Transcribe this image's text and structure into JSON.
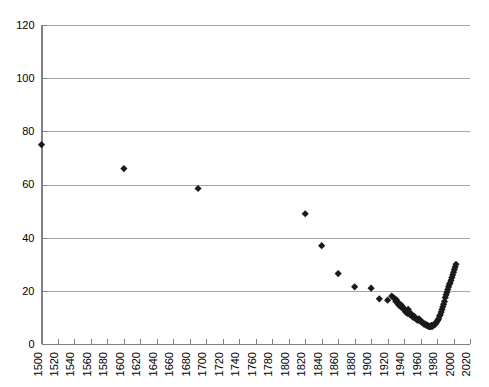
{
  "chart_data": {
    "type": "scatter",
    "title": "",
    "subtitle": "",
    "xlabel": "",
    "ylabel": "",
    "xlim": [
      1500,
      2020
    ],
    "ylim": [
      0,
      120
    ],
    "grid": true,
    "grid_axis": "y",
    "legend": false,
    "legend_position": "none",
    "marker": "diamond",
    "marker_color": "#1a1a1a",
    "y_ticks": [
      0,
      20,
      40,
      60,
      80,
      100,
      120
    ],
    "y_tick_labels": [
      "0",
      "20",
      "40",
      "60",
      "80",
      "100",
      "120"
    ],
    "x_ticks": [
      1500,
      1520,
      1540,
      1560,
      1580,
      1600,
      1620,
      1640,
      1660,
      1680,
      1700,
      1720,
      1740,
      1760,
      1780,
      1800,
      1820,
      1840,
      1860,
      1880,
      1900,
      1920,
      1940,
      1960,
      1980,
      2000,
      2020
    ],
    "x_tick_labels": [
      "1500",
      "1520",
      "1540",
      "1560",
      "1580",
      "1600",
      "1620",
      "1640",
      "1660",
      "1680",
      "1700",
      "1720",
      "1740",
      "1760",
      "1780",
      "1800",
      "1820",
      "1840",
      "1860",
      "1880",
      "1900",
      "1920",
      "1940",
      "1960",
      "1980",
      "2000",
      "2020"
    ],
    "x_tick_label_rotation": -90,
    "series": [
      {
        "name": "series-1",
        "points": [
          [
            1500,
            75.0
          ],
          [
            1600,
            66.0
          ],
          [
            1690,
            58.5
          ],
          [
            1820,
            49.0
          ],
          [
            1840,
            37.0
          ],
          [
            1860,
            26.5
          ],
          [
            1880,
            21.5
          ],
          [
            1900,
            21.0
          ],
          [
            1910,
            17.0
          ],
          [
            1920,
            16.5
          ],
          [
            1925,
            18.0
          ],
          [
            1927,
            17.5
          ],
          [
            1929,
            17.0
          ],
          [
            1930,
            16.0
          ],
          [
            1931,
            16.5
          ],
          [
            1932,
            15.5
          ],
          [
            1933,
            15.0
          ],
          [
            1934,
            14.5
          ],
          [
            1935,
            15.0
          ],
          [
            1936,
            14.0
          ],
          [
            1937,
            14.5
          ],
          [
            1938,
            14.0
          ],
          [
            1939,
            13.5
          ],
          [
            1940,
            13.0
          ],
          [
            1941,
            12.5
          ],
          [
            1942,
            12.0
          ],
          [
            1943,
            12.5
          ],
          [
            1944,
            11.5
          ],
          [
            1945,
            13.0
          ],
          [
            1946,
            12.0
          ],
          [
            1947,
            11.0
          ],
          [
            1948,
            11.5
          ],
          [
            1949,
            11.0
          ],
          [
            1950,
            10.5
          ],
          [
            1951,
            10.0
          ],
          [
            1952,
            10.5
          ],
          [
            1953,
            10.0
          ],
          [
            1954,
            9.5
          ],
          [
            1955,
            9.5
          ],
          [
            1956,
            9.0
          ],
          [
            1957,
            9.0
          ],
          [
            1958,
            9.5
          ],
          [
            1959,
            9.0
          ],
          [
            1960,
            8.5
          ],
          [
            1961,
            8.5
          ],
          [
            1962,
            8.0
          ],
          [
            1963,
            8.0
          ],
          [
            1964,
            7.5
          ],
          [
            1965,
            7.5
          ],
          [
            1966,
            7.5
          ],
          [
            1967,
            7.0
          ],
          [
            1968,
            7.0
          ],
          [
            1969,
            7.0
          ],
          [
            1970,
            6.5
          ],
          [
            1971,
            6.5
          ],
          [
            1972,
            6.5
          ],
          [
            1973,
            7.0
          ],
          [
            1974,
            6.5
          ],
          [
            1975,
            7.0
          ],
          [
            1976,
            7.0
          ],
          [
            1977,
            7.5
          ],
          [
            1978,
            7.5
          ],
          [
            1979,
            8.0
          ],
          [
            1980,
            8.5
          ],
          [
            1981,
            9.0
          ],
          [
            1982,
            9.5
          ],
          [
            1983,
            10.5
          ],
          [
            1984,
            11.0
          ],
          [
            1985,
            12.0
          ],
          [
            1986,
            13.0
          ],
          [
            1987,
            14.0
          ],
          [
            1988,
            15.0
          ],
          [
            1989,
            16.0
          ],
          [
            1990,
            17.5
          ],
          [
            1991,
            18.5
          ],
          [
            1992,
            19.5
          ],
          [
            1993,
            20.5
          ],
          [
            1994,
            21.5
          ],
          [
            1995,
            22.5
          ],
          [
            1996,
            23.0
          ],
          [
            1997,
            24.0
          ],
          [
            1998,
            25.0
          ],
          [
            1999,
            26.0
          ],
          [
            2000,
            27.0
          ],
          [
            2001,
            28.0
          ],
          [
            2002,
            29.0
          ],
          [
            2003,
            30.0
          ]
        ]
      }
    ]
  }
}
